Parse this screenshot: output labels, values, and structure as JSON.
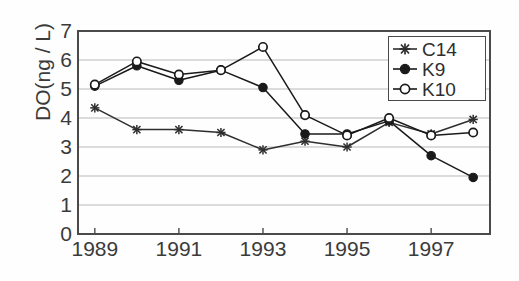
{
  "chart_data": {
    "type": "line",
    "title": "",
    "xlabel": "",
    "ylabel": "DO(ng / L)",
    "x": [
      1989,
      1990,
      1991,
      1992,
      1993,
      1994,
      1995,
      1996,
      1997,
      1998
    ],
    "xlim": [
      1988.6,
      1998.4
    ],
    "ylim": [
      0,
      7
    ],
    "xticks_labeled": [
      "1989",
      "1991",
      "1993",
      "1995",
      "1997"
    ],
    "xticks_labeled_values": [
      1989,
      1991,
      1993,
      1995,
      1997
    ],
    "yticks": [
      "0",
      "1",
      "2",
      "3",
      "4",
      "5",
      "6",
      "7"
    ],
    "ytick_values": [
      0,
      1,
      2,
      3,
      4,
      5,
      6,
      7
    ],
    "grid": "horizontal",
    "legend_position": "top-right",
    "series": [
      {
        "name": "C14",
        "marker": "star",
        "color": "#2e2e2e",
        "x": [
          1989,
          1990,
          1991,
          1992,
          1993,
          1994,
          1995,
          1996,
          1997,
          1998
        ],
        "values": [
          4.35,
          3.6,
          3.6,
          3.5,
          2.9,
          3.2,
          3.0,
          3.85,
          3.45,
          3.95
        ]
      },
      {
        "name": "K9",
        "marker": "filled-circle",
        "color": "#1a1a1a",
        "x": [
          1989,
          1990,
          1991,
          1992,
          1993,
          1994,
          1995,
          1996,
          1997,
          1998
        ],
        "values": [
          5.1,
          5.8,
          5.3,
          5.65,
          5.05,
          3.45,
          3.45,
          3.9,
          2.7,
          1.95
        ]
      },
      {
        "name": "K10",
        "marker": "open-circle",
        "color": "#1a1a1a",
        "x": [
          1989,
          1990,
          1991,
          1992,
          1993,
          1994,
          1995,
          1996,
          1997,
          1998
        ],
        "values": [
          5.15,
          5.95,
          5.5,
          5.65,
          6.45,
          4.1,
          3.4,
          4.0,
          3.4,
          3.5
        ]
      }
    ]
  },
  "legend": {
    "items": [
      {
        "label": "C14"
      },
      {
        "label": "K9"
      },
      {
        "label": "K10"
      }
    ]
  },
  "colors": {
    "axis": "#4a4a4a",
    "grid": "#b8b8b8",
    "text": "#3b3b3b",
    "series_c14": "#2e2e2e",
    "series_k9": "#1a1a1a",
    "series_k10": "#1a1a1a"
  }
}
